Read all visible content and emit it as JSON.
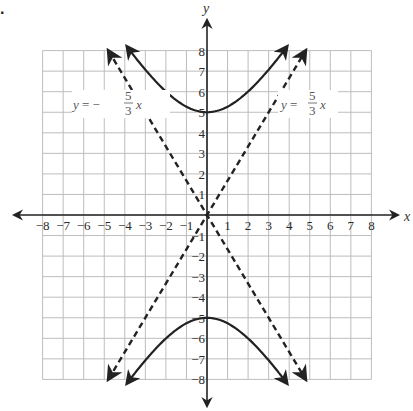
{
  "problem_marker": ".",
  "chart_data": {
    "type": "line",
    "title": "",
    "xlabel": "x",
    "ylabel": "y",
    "xlim": [
      -8,
      8
    ],
    "ylim": [
      -8,
      8
    ],
    "grid": true,
    "x_ticks": [
      "-8",
      "-7",
      "-6",
      "-5",
      "-4",
      "-3",
      "-2",
      "-1",
      "1",
      "2",
      "3",
      "4",
      "5",
      "6",
      "7",
      "8"
    ],
    "y_ticks": [
      "8",
      "7",
      "6",
      "5",
      "4",
      "3",
      "2",
      "1",
      "-1",
      "-2",
      "-3",
      "-4",
      "-5",
      "-6",
      "-7",
      "-8"
    ],
    "series": [
      {
        "name": "hyperbola upper branch",
        "style": "solid",
        "equation": "y^2/25 - x^2/9 = 1 (upper)",
        "vertex": [
          0,
          5
        ],
        "x_range": [
          -3.9,
          3.9
        ]
      },
      {
        "name": "hyperbola lower branch",
        "style": "solid",
        "equation": "y^2/25 - x^2/9 = 1 (lower)",
        "vertex": [
          0,
          -5
        ],
        "x_range": [
          -3.9,
          3.9
        ]
      },
      {
        "name": "asymptote y = 5/3 x",
        "style": "dashed",
        "slope": 1.6667,
        "x_range": [
          -4.8,
          4.8
        ]
      },
      {
        "name": "asymptote y = -5/3 x",
        "style": "dashed",
        "slope": -1.6667,
        "x_range": [
          -4.8,
          4.8
        ]
      }
    ],
    "annotations": [
      {
        "text": "y = -5/3 x",
        "position": [
          -5.5,
          5
        ]
      },
      {
        "text": "y = 5/3 x",
        "position": [
          5.5,
          5
        ]
      }
    ]
  },
  "labels": {
    "left_eq": {
      "prefix": "y = −",
      "num": "5",
      "den": "3",
      "var": "x"
    },
    "right_eq": {
      "prefix": "y = ",
      "num": "5",
      "den": "3",
      "var": "x"
    }
  }
}
